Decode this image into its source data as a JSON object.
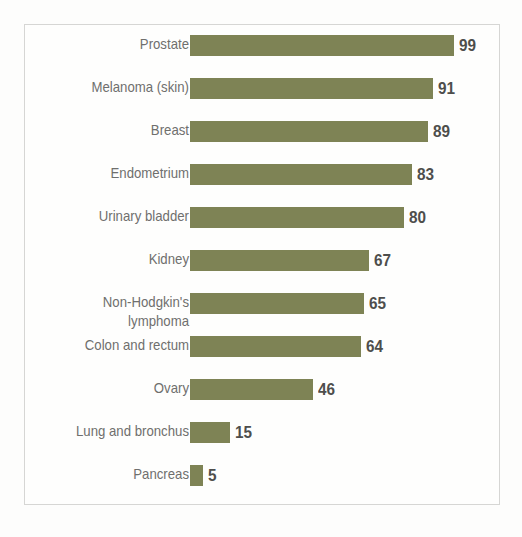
{
  "chart": {
    "title": "",
    "frame_color": "#d6d6d4",
    "bar_color": "#7e8355",
    "label_color": "#6f6f6d",
    "value_color": "#4e4e4c",
    "background": "#fdfdfc"
  },
  "chart_data": {
    "type": "bar",
    "orientation": "horizontal",
    "title": "",
    "xlabel": "",
    "ylabel": "",
    "xlim": [
      0,
      100
    ],
    "grid": false,
    "legend": "none",
    "categories": [
      "Prostate",
      "Melanoma (skin)",
      "Breast",
      "Endometrium",
      "Urinary bladder",
      "Kidney",
      "Non-Hodgkin's\nlymphoma",
      "Colon and rectum",
      "Ovary",
      "Lung and bronchus",
      "Pancreas"
    ],
    "values": [
      99,
      91,
      89,
      83,
      80,
      67,
      65,
      64,
      46,
      15,
      5
    ],
    "value_labels": [
      "99",
      "91",
      "89",
      "83",
      "80",
      "67",
      "65",
      "64",
      "46",
      "15",
      "5"
    ]
  }
}
